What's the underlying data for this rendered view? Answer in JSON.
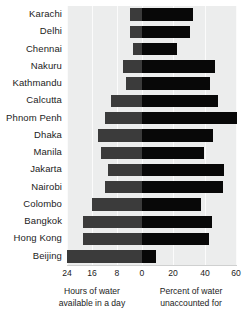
{
  "chart_data": {
    "type": "bar",
    "orientation": "horizontal",
    "subtype": "bidirectional-diverging",
    "title": "",
    "categories": [
      "Karachi",
      "Delhi",
      "Chennai",
      "Nakuru",
      "Kathmandu",
      "Calcutta",
      "Phnom Penh",
      "Dhaka",
      "Manila",
      "Jakarta",
      "Nairobi",
      "Colombo",
      "Bangkok",
      "Hong Kong",
      "Beijing"
    ],
    "series": [
      {
        "name": "Hours of water available in a day",
        "axis": "left",
        "direction": "left",
        "color": "#3b3b3b",
        "axis_label": "Hours of water available in a day",
        "ticks": [
          24,
          16,
          8,
          0
        ],
        "axis_max": 24,
        "values": [
          4,
          4,
          3,
          6,
          5,
          10,
          12,
          14,
          13,
          11,
          12,
          16,
          19,
          19,
          24
        ]
      },
      {
        "name": "Percent of water unaccounted for",
        "axis": "right",
        "direction": "right",
        "color": "#080808",
        "axis_label": "Percent of water unaccounted for",
        "ticks": [
          0,
          20,
          40,
          60
        ],
        "axis_max": 60,
        "values": [
          32,
          30,
          22,
          46,
          43,
          48,
          60,
          45,
          39,
          52,
          51,
          37,
          44,
          42,
          9
        ]
      }
    ],
    "grid": true,
    "gridlines_left": [
      24,
      16,
      8
    ],
    "gridlines_right": [
      20,
      40,
      60
    ],
    "legend": "none",
    "background": "#eceded"
  },
  "axis": {
    "left_ticks": [
      "24",
      "16",
      "8",
      "0"
    ],
    "right_ticks": [
      "20",
      "40",
      "60"
    ],
    "caption_left": "Hours of water\navailable in a day",
    "caption_left_line1": "Hours of water",
    "caption_left_line2": "available in a day",
    "caption_right_line1": "Percent of water",
    "caption_right_line2": "unaccounted for"
  }
}
